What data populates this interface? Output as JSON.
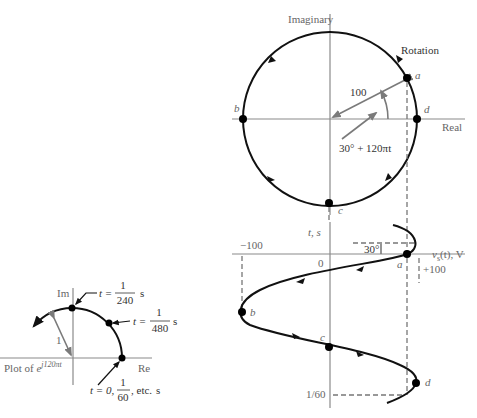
{
  "phasor_diagram": {
    "axis_labels": {
      "imaginary": "Imaginary",
      "real": "Real"
    },
    "rotation_label": "Rotation",
    "magnitude_label": "100",
    "angle_label": "30° + 120πt",
    "points": [
      {
        "name": "a",
        "label": "a"
      },
      {
        "name": "b",
        "label": "b"
      },
      {
        "name": "c",
        "label": "c"
      },
      {
        "name": "d",
        "label": "d"
      }
    ],
    "center": [
      330,
      119
    ],
    "radius": 87
  },
  "waveform": {
    "time_axis_label": "t, s",
    "voltage_axis_label": "vs(t), V",
    "voltage_axis_label_main": "v",
    "voltage_axis_label_sub": "s",
    "voltage_axis_label_rest": "(t), V",
    "neg_peak_label": "−100",
    "pos_peak_label": "+100",
    "origin_label": "0",
    "period_label": "1/60",
    "phase_label": "30°",
    "points": [
      {
        "name": "a",
        "label": "a"
      },
      {
        "name": "b",
        "label": "b"
      },
      {
        "name": "c",
        "label": "c"
      },
      {
        "name": "d",
        "label": "d"
      }
    ]
  },
  "unit_phasor_plot": {
    "title_prefix": "Plot of ",
    "title_base": "e",
    "title_exponent": "j120πt",
    "im_label": "Im",
    "re_label": "Re",
    "radius_label": "1",
    "annotations": [
      {
        "prefix": "t = ",
        "numerator": "1",
        "denominator": "240",
        "unit": "s"
      },
      {
        "prefix": "t = ",
        "numerator": "1",
        "denominator": "480",
        "unit": "s"
      },
      {
        "prefix": "t = 0,",
        "numerator": "1",
        "denominator": "60",
        "suffix": ", etc.",
        "unit": "s"
      }
    ]
  }
}
